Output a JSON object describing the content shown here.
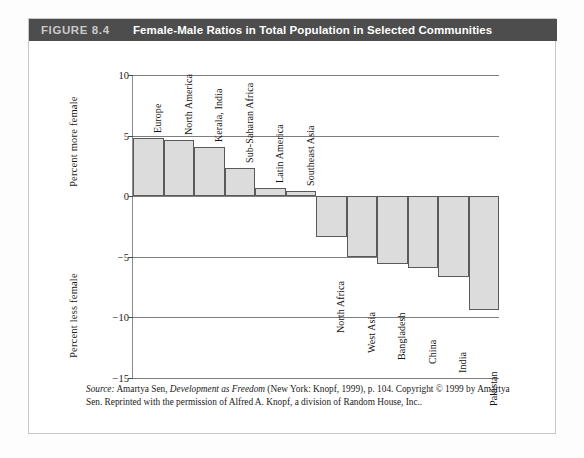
{
  "figure": {
    "number": "FIGURE 8.4",
    "title": "Female-Male Ratios in Total Population in Selected Communities"
  },
  "axis": {
    "upper_title": "Percent more female",
    "lower_title": "Percent less female"
  },
  "source": {
    "label": "Source:",
    "text_1": " Amartya Sen, ",
    "work": "Development as Freedom",
    "text_2": " (New York: Knopf, 1999), p. 104. Copyright © 1999 by Amartya Sen. Reprinted with the permission of Alfred A. Knopf, a division of Random House, Inc.."
  },
  "colors": {
    "header_bg": "#4d4d4d",
    "header_number": "#c9c9c9",
    "header_title": "#ffffff",
    "bar_fill": "#dcdcdc",
    "bar_stroke": "#5a5a5a",
    "gridline": "#7d7d7d",
    "card_border": "#c8c8c8"
  },
  "chart_data": {
    "type": "bar",
    "title": "Female-Male Ratios in Total Population in Selected Communities",
    "xlabel": "",
    "ylabel": "Percent more female / Percent less female",
    "ylim": [
      -15,
      10
    ],
    "yticks": [
      10,
      5,
      0,
      -5,
      -10,
      -15
    ],
    "ytick_labels": [
      "10",
      "5",
      "0",
      "−5",
      "−10",
      "−15"
    ],
    "grid": true,
    "legend": "none",
    "orientation": "vertical",
    "categories": [
      "Europe",
      "North America",
      "Kerala, India",
      "Sub-Saharan Africa",
      "Latin America",
      "Southeast Asia",
      "North Africa",
      "West Asia",
      "Bangladesh",
      "China",
      "India",
      "Pakistan"
    ],
    "values": [
      4.8,
      4.6,
      4.1,
      2.3,
      0.7,
      0.45,
      -3.4,
      -5.0,
      -5.6,
      -5.9,
      -6.7,
      -9.4
    ]
  }
}
